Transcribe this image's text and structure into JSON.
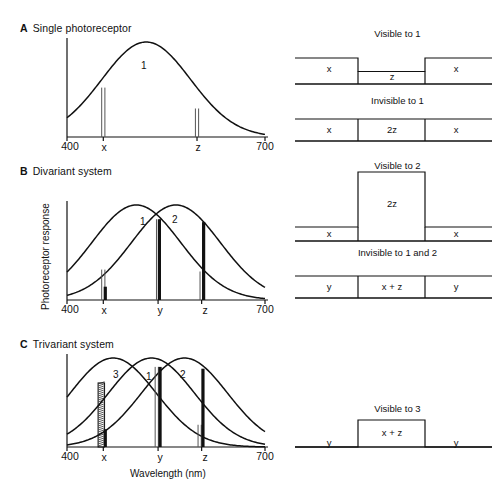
{
  "figure": {
    "y_axis_label": "Photoreceptor response",
    "x_axis_label": "Wavelength (nm)"
  },
  "sections": [
    {
      "letter": "A",
      "title": "Single photoreceptor",
      "plot": {
        "x_ticks": [
          {
            "label": "400",
            "value": 400
          },
          {
            "label": "x",
            "value": 455
          },
          {
            "label": "z",
            "value": 597
          },
          {
            "label": "700",
            "value": 700
          }
        ],
        "curves": [
          {
            "label": "1",
            "peak": 520,
            "width": 95,
            "height": 1.0
          }
        ],
        "markers": [
          {
            "label": "x",
            "value": 455,
            "style": "thin-double",
            "height": 0.52
          },
          {
            "label": "z",
            "value": 597,
            "style": "thin-double",
            "height": 0.3
          }
        ]
      },
      "right_panels": [
        {
          "title": "Visible to 1",
          "type": "notch",
          "segments": [
            {
              "label": "x",
              "level": "high"
            },
            {
              "label": "z",
              "level": "low"
            },
            {
              "label": "x",
              "level": "high"
            }
          ]
        },
        {
          "title": "Invisible to 1",
          "type": "flat",
          "segments": [
            {
              "label": "x",
              "level": "high"
            },
            {
              "label": "2z",
              "level": "high"
            },
            {
              "label": "x",
              "level": "high"
            }
          ]
        }
      ]
    },
    {
      "letter": "B",
      "title": "Divariant system",
      "plot": {
        "x_ticks": [
          {
            "label": "400",
            "value": 400
          },
          {
            "label": "x",
            "value": 455
          },
          {
            "label": "y",
            "value": 538
          },
          {
            "label": "z",
            "value": 604
          },
          {
            "label": "700",
            "value": 700
          }
        ],
        "curves": [
          {
            "label": "1",
            "peak": 505,
            "width": 95,
            "height": 1.0
          },
          {
            "label": "2",
            "peak": 565,
            "width": 95,
            "height": 1.0
          }
        ],
        "markers": [
          {
            "label": "x",
            "value": 455,
            "style": "thin-double",
            "height": 0.32
          },
          {
            "label": "x",
            "value": 458,
            "style": "thick",
            "height": 0.14
          },
          {
            "label": "y",
            "value": 538,
            "style": "thin-double",
            "height": 0.85
          },
          {
            "label": "y",
            "value": 540,
            "style": "thick",
            "height": 0.85
          },
          {
            "label": "z",
            "value": 604,
            "style": "thin-double",
            "height": 0.3
          },
          {
            "label": "z",
            "value": 607,
            "style": "thick",
            "height": 0.82
          }
        ]
      },
      "right_panels": [
        {
          "title": "Visible to 2",
          "type": "tall-box",
          "segments": [
            {
              "label": "x",
              "level": "low"
            },
            {
              "label": "2z",
              "level": "tall"
            },
            {
              "label": "x",
              "level": "low"
            }
          ]
        },
        {
          "title": "Invisible to 1 and 2",
          "type": "flat",
          "segments": [
            {
              "label": "y",
              "level": "high"
            },
            {
              "label": "x + z",
              "level": "high"
            },
            {
              "label": "y",
              "level": "high"
            }
          ]
        }
      ]
    },
    {
      "letter": "C",
      "title": "Trivariant system",
      "plot": {
        "x_ticks": [
          {
            "label": "400",
            "value": 400
          },
          {
            "label": "x",
            "value": 455
          },
          {
            "label": "y",
            "value": 538
          },
          {
            "label": "z",
            "value": 604
          },
          {
            "label": "700",
            "value": 700
          }
        ],
        "curves": [
          {
            "label": "3",
            "peak": 470,
            "width": 92,
            "height": 1.0
          },
          {
            "label": "1",
            "peak": 528,
            "width": 92,
            "height": 1.0
          },
          {
            "label": "2",
            "peak": 578,
            "width": 92,
            "height": 1.0
          }
        ],
        "markers": [
          {
            "label": "x",
            "value": 452,
            "style": "hatched",
            "height": 0.72
          },
          {
            "label": "x",
            "value": 458,
            "style": "thick",
            "height": 0.2
          },
          {
            "label": "y",
            "value": 536,
            "style": "thin-double",
            "height": 0.9
          },
          {
            "label": "y",
            "value": 541,
            "style": "thick",
            "height": 0.9
          },
          {
            "label": "z",
            "value": 601,
            "style": "thin-double",
            "height": 0.25
          },
          {
            "label": "z",
            "value": 606,
            "style": "thick",
            "height": 0.88
          }
        ]
      },
      "right_panels": [
        {
          "title": "Visible to 3",
          "type": "box-on-line",
          "segments": [
            {
              "label": "y",
              "level": "base"
            },
            {
              "label": "x + z",
              "level": "box"
            },
            {
              "label": "y",
              "level": "base"
            }
          ]
        }
      ]
    }
  ],
  "chart_data": {
    "type": "line",
    "xlabel": "Wavelength (nm)",
    "ylabel": "Photoreceptor response",
    "xlim": [
      400,
      700
    ],
    "ylim": [
      0,
      1
    ],
    "grid": false,
    "legend": "inline curve labels",
    "panels": [
      {
        "panel": "A",
        "name": "Single photoreceptor",
        "series": [
          {
            "name": "1",
            "peak_nm": 520,
            "halfwidth_nm": 95,
            "peak_response": 1.0
          }
        ],
        "stimuli": [
          {
            "name": "x",
            "wavelength_nm": 455,
            "response": 0.52
          },
          {
            "name": "z",
            "wavelength_nm": 597,
            "response": 0.3
          }
        ]
      },
      {
        "panel": "B",
        "name": "Divariant system",
        "series": [
          {
            "name": "1",
            "peak_nm": 505,
            "halfwidth_nm": 95,
            "peak_response": 1.0
          },
          {
            "name": "2",
            "peak_nm": 565,
            "halfwidth_nm": 95,
            "peak_response": 1.0
          }
        ],
        "stimuli": [
          {
            "name": "x",
            "wavelength_nm": 455,
            "response": 0.32
          },
          {
            "name": "y",
            "wavelength_nm": 538,
            "response": 0.85
          },
          {
            "name": "z",
            "wavelength_nm": 604,
            "response": 0.82
          }
        ]
      },
      {
        "panel": "C",
        "name": "Trivariant system",
        "series": [
          {
            "name": "3",
            "peak_nm": 470,
            "halfwidth_nm": 92,
            "peak_response": 1.0
          },
          {
            "name": "1",
            "peak_nm": 528,
            "halfwidth_nm": 92,
            "peak_response": 1.0
          },
          {
            "name": "2",
            "peak_nm": 578,
            "halfwidth_nm": 92,
            "peak_response": 1.0
          }
        ],
        "stimuli": [
          {
            "name": "x",
            "wavelength_nm": 452,
            "response": 0.72
          },
          {
            "name": "y",
            "wavelength_nm": 538,
            "response": 0.9
          },
          {
            "name": "z",
            "wavelength_nm": 604,
            "response": 0.88
          }
        ]
      }
    ]
  }
}
